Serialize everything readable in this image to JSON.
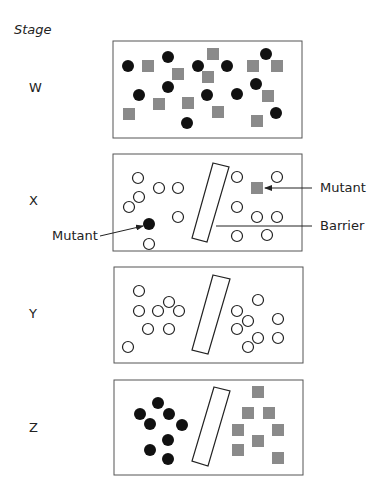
{
  "title": "Stage",
  "colors": {
    "filled_circle": "#111111",
    "square": "#8a8a8a",
    "outline": "#222222",
    "box_border": "#555555",
    "background": "#ffffff"
  },
  "panels": [
    {
      "label": "W",
      "barrier": false,
      "filled_circles": [
        [
          128,
          66
        ],
        [
          168,
          57
        ],
        [
          198,
          66
        ],
        [
          227,
          66
        ],
        [
          266,
          54
        ],
        [
          168,
          87
        ],
        [
          139,
          95
        ],
        [
          207,
          95
        ],
        [
          237,
          94
        ],
        [
          256,
          84
        ],
        [
          276,
          113
        ],
        [
          187,
          123
        ]
      ],
      "open_circles": [],
      "squares": [
        [
          148,
          66
        ],
        [
          213,
          54
        ],
        [
          178,
          74
        ],
        [
          208,
          77
        ],
        [
          253,
          66
        ],
        [
          277,
          66
        ],
        [
          268,
          96
        ],
        [
          159,
          104
        ],
        [
          188,
          103
        ],
        [
          218,
          112
        ],
        [
          129,
          114
        ],
        [
          257,
          121
        ]
      ]
    },
    {
      "label": "X",
      "barrier": true,
      "filled_circles": [
        [
          149,
          224
        ]
      ],
      "open_circles": [
        [
          138,
          178
        ],
        [
          159,
          188
        ],
        [
          178,
          188
        ],
        [
          139,
          197
        ],
        [
          129,
          207
        ],
        [
          178,
          217
        ],
        [
          149,
          244
        ],
        [
          237,
          177
        ],
        [
          277,
          177
        ],
        [
          237,
          207
        ],
        [
          257,
          217
        ],
        [
          277,
          217
        ],
        [
          237,
          236
        ],
        [
          267,
          235
        ]
      ],
      "squares": [
        [
          257,
          188
        ]
      ]
    },
    {
      "label": "Y",
      "barrier": true,
      "filled_circles": [],
      "open_circles": [
        [
          139,
          291
        ],
        [
          139,
          311
        ],
        [
          158,
          311
        ],
        [
          169,
          302
        ],
        [
          179,
          311
        ],
        [
          148,
          329
        ],
        [
          169,
          329
        ],
        [
          128,
          347
        ],
        [
          258,
          300
        ],
        [
          237,
          311
        ],
        [
          248,
          321
        ],
        [
          237,
          329
        ],
        [
          278,
          319
        ],
        [
          258,
          338
        ],
        [
          278,
          338
        ],
        [
          248,
          347
        ]
      ],
      "squares": []
    },
    {
      "label": "Z",
      "barrier": true,
      "filled_circles": [
        [
          158,
          403
        ],
        [
          140,
          414
        ],
        [
          169,
          414
        ],
        [
          150,
          424
        ],
        [
          182,
          425
        ],
        [
          168,
          440
        ],
        [
          150,
          450
        ],
        [
          168,
          459
        ]
      ],
      "open_circles": [],
      "squares": [
        [
          258,
          392
        ],
        [
          248,
          413
        ],
        [
          269,
          413
        ],
        [
          238,
          430
        ],
        [
          278,
          430
        ],
        [
          258,
          441
        ],
        [
          238,
          450
        ],
        [
          278,
          458
        ]
      ]
    }
  ],
  "annotations": {
    "mutant_left": "Mutant",
    "mutant_right": "Mutant",
    "barrier": "Barrier"
  }
}
